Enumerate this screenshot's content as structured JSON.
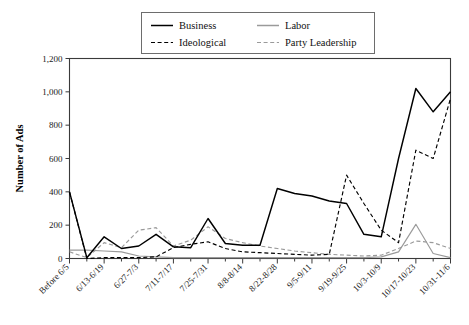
{
  "chart_data": {
    "type": "line",
    "title": "",
    "xlabel": "",
    "ylabel": "Number of Ads",
    "ylim": [
      0,
      1200
    ],
    "yticks": [
      0,
      200,
      400,
      600,
      800,
      1000,
      1200
    ],
    "ytick_labels": [
      "0",
      "200",
      "400",
      "600",
      "800",
      "1,000",
      "1,200"
    ],
    "grid": false,
    "legend_position": "top",
    "categories": [
      "Before 6/5",
      "6/6-6/12",
      "6/13-6/19",
      "6/20-6/26",
      "6/27-7/3",
      "7/4-7/10",
      "7/11-7/17",
      "7/18-7/24",
      "7/25-7/31",
      "8/1-8/7",
      "8/8-8/14",
      "8/15-8/21",
      "8/22-8/28",
      "8/29-9/4",
      "9/5-9/11",
      "9/12-9/18",
      "9/19-9/25",
      "9/26-10/2",
      "10/3-10/9",
      "10/10-10/16",
      "10/17-10/23",
      "10/24-10/30",
      "10/31-11/6"
    ],
    "xtick_labels": [
      "Before 6/5",
      "6/13-6/19",
      "6/27-7/3",
      "7/11-7/17",
      "7/25-7/31",
      "8/8-8/14",
      "8/22-8/28",
      "9/5-9/11",
      "9/19-9/25",
      "10/3-10/9",
      "10/17-10/23",
      "10/31-11/6"
    ],
    "xtick_indices": [
      0,
      2,
      4,
      6,
      8,
      10,
      12,
      14,
      16,
      18,
      20,
      22
    ],
    "series": [
      {
        "name": "Business",
        "style": "solid",
        "color": "#000000",
        "values": [
          400,
          5,
          130,
          60,
          75,
          145,
          70,
          65,
          240,
          90,
          80,
          80,
          420,
          390,
          375,
          345,
          330,
          145,
          130,
          600,
          1020,
          880,
          1000
        ]
      },
      {
        "name": "Ideological",
        "style": "dashed",
        "color": "#000000",
        "values": [
          400,
          0,
          5,
          5,
          5,
          10,
          65,
          85,
          100,
          60,
          40,
          35,
          30,
          25,
          20,
          25,
          500,
          330,
          170,
          95,
          650,
          600,
          960
        ]
      },
      {
        "name": "Labor",
        "style": "solid",
        "color": "#9a9a9a",
        "values": [
          50,
          50,
          45,
          40,
          15,
          10,
          5,
          5,
          5,
          5,
          5,
          5,
          5,
          5,
          5,
          5,
          5,
          5,
          10,
          40,
          205,
          30,
          5
        ]
      },
      {
        "name": "Party Leadership",
        "style": "dashed",
        "color": "#9a9a9a",
        "values": [
          40,
          5,
          95,
          65,
          170,
          185,
          75,
          110,
          190,
          120,
          95,
          75,
          60,
          45,
          35,
          25,
          20,
          15,
          20,
          60,
          105,
          95,
          60
        ]
      }
    ]
  },
  "legend": {
    "items": [
      {
        "label": "Business"
      },
      {
        "label": "Labor"
      },
      {
        "label": "Ideological"
      },
      {
        "label": "Party Leadership"
      }
    ]
  }
}
